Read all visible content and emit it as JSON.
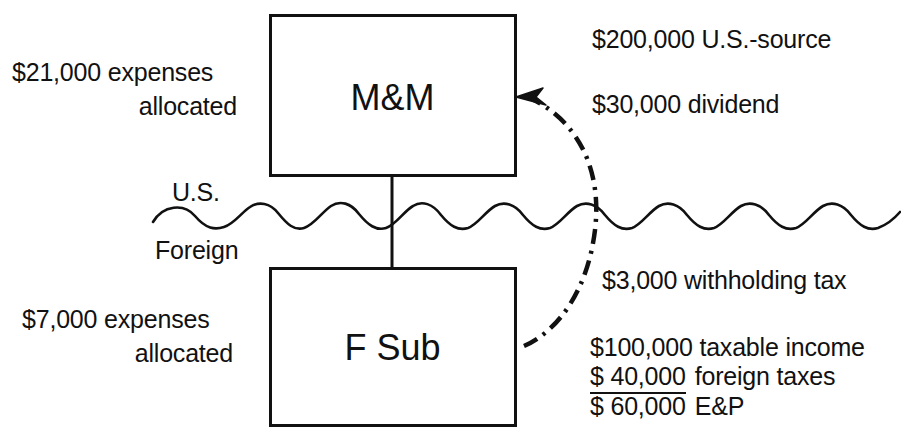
{
  "diagram": {
    "entities": {
      "parent": {
        "name": "M&M",
        "box": {
          "x": 270,
          "y": 15,
          "w": 245,
          "h": 160
        }
      },
      "subsidiary": {
        "name": "F Sub",
        "box": {
          "x": 270,
          "y": 268,
          "w": 245,
          "h": 157
        }
      }
    },
    "border": {
      "upper_label": "U.S.",
      "lower_label": "Foreign"
    },
    "left_annotations": {
      "parent_expenses_line1": "$21,000 expenses",
      "parent_expenses_line2": "allocated",
      "sub_expenses_line1": "$7,000 expenses",
      "sub_expenses_line2": "allocated"
    },
    "right_annotations": {
      "us_source": "$200,000 U.S.-source",
      "dividend": "$30,000 dividend",
      "withholding": "$3,000 withholding tax",
      "taxable_income": "$100,000 taxable income",
      "foreign_taxes_amount": "$  40,000",
      "foreign_taxes_label": "foreign taxes",
      "ep_amount": "$  60,000",
      "ep_label": "E&P"
    },
    "colors": {
      "ink": "#111111",
      "background": "#ffffff"
    },
    "flow_arrow": {
      "from": "F Sub",
      "to": "M&M",
      "style": "dash-dot curved arrow"
    }
  }
}
